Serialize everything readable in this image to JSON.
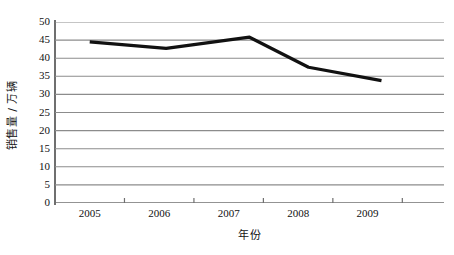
{
  "chart_data": {
    "type": "line",
    "title": "",
    "xlabel": "年份",
    "ylabel": "销售量 / 万辆",
    "xlim": [
      2004.5,
      2010.1
    ],
    "ylim": [
      0,
      50
    ],
    "grid": true,
    "legend": "none",
    "line_color": "#111111",
    "grid_color": "#8c8c8c",
    "axis_color": "#6f6f6f",
    "categories": [
      "2005",
      "2006",
      "2007",
      "2008",
      "2009"
    ],
    "y_ticks": [
      "0",
      "5",
      "10",
      "15",
      "20",
      "25",
      "30",
      "35",
      "40",
      "45",
      "50"
    ],
    "y_tick_values": [
      0,
      5,
      10,
      15,
      20,
      25,
      30,
      35,
      40,
      45,
      50
    ],
    "x_tick_values": [
      2005,
      2006,
      2007,
      2008,
      2009
    ],
    "series": [
      {
        "name": "销售量",
        "x": [
          2005.0,
          2006.1,
          2007.3,
          2008.15,
          2009.2
        ],
        "values": [
          44.5,
          42.7,
          45.8,
          37.5,
          33.8
        ]
      }
    ]
  }
}
